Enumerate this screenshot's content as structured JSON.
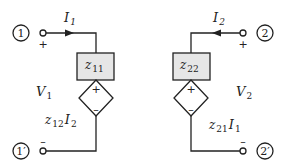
{
  "diagram": {
    "type": "z-parameter two-port equivalent circuit",
    "colors": {
      "line": "#222222",
      "box_fill": "#e6e6e6",
      "background": "#ffffff"
    },
    "ports": {
      "left_top": {
        "node_label": "1",
        "polarity": "+"
      },
      "left_bottom": {
        "node_label": "1′",
        "polarity": "–"
      },
      "right_top": {
        "node_label": "2",
        "polarity": "+"
      },
      "right_bottom": {
        "node_label": "2′",
        "polarity": "–"
      }
    },
    "currents": {
      "left": {
        "symbol": "I",
        "subscript": "1"
      },
      "right": {
        "symbol": "I",
        "subscript": "2"
      }
    },
    "voltages": {
      "left": {
        "symbol": "V",
        "subscript": "1"
      },
      "right": {
        "symbol": "V",
        "subscript": "2"
      }
    },
    "impedances": {
      "left": {
        "symbol": "z",
        "subscript": "11"
      },
      "right": {
        "symbol": "z",
        "subscript": "22"
      }
    },
    "dependent_sources": {
      "left": {
        "coef": "z",
        "coef_sub": "12",
        "var": "I",
        "var_sub": "2",
        "plus": "+",
        "minus": "–"
      },
      "right": {
        "coef": "z",
        "coef_sub": "21",
        "var": "I",
        "var_sub": "1",
        "plus": "+",
        "minus": "–"
      }
    }
  }
}
